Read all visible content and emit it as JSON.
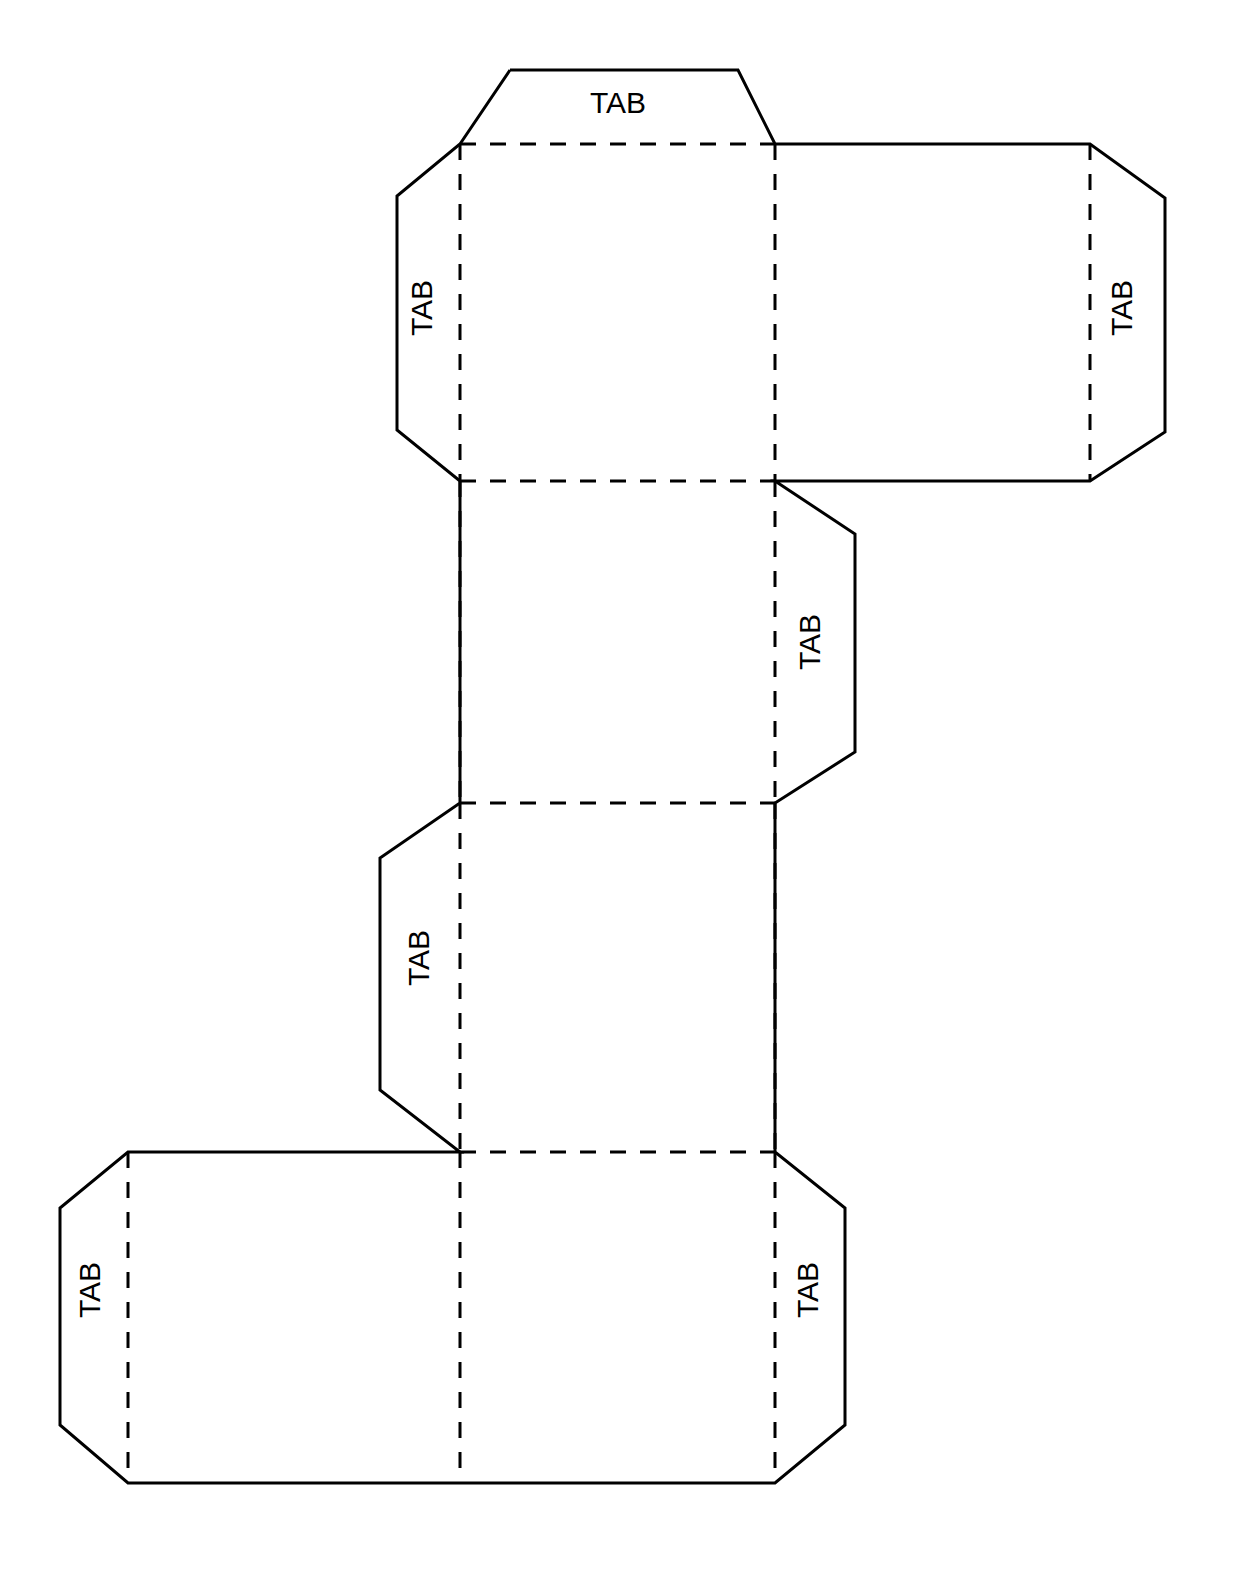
{
  "document": {
    "title": "Cube Net Papercraft Template",
    "description": "Printable fold-out net of a rectangular box with glue tabs",
    "background_color": "#ffffff",
    "line_color": "#000000",
    "cut_line_width": 3,
    "fold_line_width": 3,
    "fold_dash_pattern": "16 14",
    "canvas": {
      "width": 1248,
      "height": 1596
    }
  },
  "labels": {
    "tab_text": "TAB",
    "font_size": 30
  },
  "geometry": {
    "grid_x": [
      60,
      128,
      397,
      460,
      775,
      845,
      855,
      1090,
      1165
    ],
    "grid_y": [
      70,
      144,
      481,
      803,
      1152,
      1483
    ]
  },
  "panels": [
    {
      "id": "panel-top-face",
      "name": "top-face",
      "x1": 460,
      "y1": 144,
      "x2": 775,
      "y2": 481
    },
    {
      "id": "panel-right-face",
      "name": "right-face",
      "x1": 775,
      "y1": 144,
      "x2": 1090,
      "y2": 481
    },
    {
      "id": "panel-upper-middle-face",
      "name": "upper-middle-face",
      "x1": 460,
      "y1": 481,
      "x2": 775,
      "y2": 803
    },
    {
      "id": "panel-lower-middle-face",
      "name": "lower-middle-face",
      "x1": 460,
      "y1": 803,
      "x2": 775,
      "y2": 1152
    },
    {
      "id": "panel-bottom-left-face",
      "name": "bottom-left-face",
      "x1": 128,
      "y1": 1152,
      "x2": 460,
      "y2": 1483
    },
    {
      "id": "panel-bottom-right-face",
      "name": "bottom-right-face",
      "x1": 460,
      "y1": 1152,
      "x2": 775,
      "y2": 1483
    }
  ],
  "tabs": [
    {
      "id": "tab-top",
      "name": "tab-top",
      "label": "TAB",
      "orientation": "horizontal",
      "rotation": 0,
      "label_x": 618,
      "label_y": 105,
      "outline": "460,144 510,70 738,70 775,144"
    },
    {
      "id": "tab-top-left",
      "name": "tab-top-left",
      "label": "TAB",
      "orientation": "vertical",
      "rotation": -90,
      "label_x": 424,
      "label_y": 308,
      "outline": "460,144 397,196 397,430 460,481"
    },
    {
      "id": "tab-far-right",
      "name": "tab-far-right",
      "label": "TAB",
      "orientation": "vertical",
      "rotation": -90,
      "label_x": 1124,
      "label_y": 308,
      "outline": "1090,144 1165,198 1165,432 1090,481"
    },
    {
      "id": "tab-middle-right",
      "name": "tab-middle-right",
      "label": "TAB",
      "orientation": "vertical",
      "rotation": -90,
      "label_x": 812,
      "label_y": 642,
      "outline": "775,481 855,534 855,752 775,803"
    },
    {
      "id": "tab-middle-left",
      "name": "tab-middle-left",
      "label": "TAB",
      "orientation": "vertical",
      "rotation": -90,
      "label_x": 421,
      "label_y": 958,
      "outline": "460,803 380,858 380,1090 460,1152"
    },
    {
      "id": "tab-bottom-left",
      "name": "tab-bottom-left",
      "label": "TAB",
      "orientation": "vertical",
      "rotation": -90,
      "label_x": 92,
      "label_y": 1290,
      "outline": "128,1152 60,1208 60,1425 128,1483"
    },
    {
      "id": "tab-bottom-right",
      "name": "tab-bottom-right",
      "label": "TAB",
      "orientation": "vertical",
      "rotation": -90,
      "label_x": 810,
      "label_y": 1290,
      "outline": "775,1152 845,1208 845,1425 775,1483"
    }
  ],
  "cut_outline": "510,70 738,70 775,144 1090,144 1165,198 1165,432 1090,481 775,481 855,534 855,752 775,803 775,1152 845,1208 845,1425 775,1483 128,1483 60,1425 60,1208 128,1152 460,1152 380,1090 380,858 460,803 460,481 397,430 397,196 460,144 510,70",
  "fold_lines": [
    {
      "id": "fold-top-tab",
      "name": "fold-top-tab",
      "x1": 460,
      "y1": 144,
      "x2": 775,
      "y2": 144
    },
    {
      "id": "fold-top-left-tab",
      "name": "fold-top-left-tab",
      "x1": 460,
      "y1": 144,
      "x2": 460,
      "y2": 481
    },
    {
      "id": "fold-top-right-edge",
      "name": "fold-top-right-edge",
      "x1": 775,
      "y1": 144,
      "x2": 775,
      "y2": 481
    },
    {
      "id": "fold-far-right-tab",
      "name": "fold-far-right-tab",
      "x1": 1090,
      "y1": 144,
      "x2": 1090,
      "y2": 481
    },
    {
      "id": "fold-top-bottom-edge",
      "name": "fold-top-bottom-edge",
      "x1": 460,
      "y1": 481,
      "x2": 775,
      "y2": 481
    },
    {
      "id": "fold-middle-left-edge",
      "name": "fold-middle-left-edge",
      "x1": 460,
      "y1": 481,
      "x2": 460,
      "y2": 803
    },
    {
      "id": "fold-middle-right-tab",
      "name": "fold-middle-right-tab",
      "x1": 775,
      "y1": 481,
      "x2": 775,
      "y2": 803
    },
    {
      "id": "fold-middle-divider",
      "name": "fold-middle-divider",
      "x1": 460,
      "y1": 803,
      "x2": 775,
      "y2": 803
    },
    {
      "id": "fold-lower-left-tab",
      "name": "fold-lower-left-tab",
      "x1": 460,
      "y1": 803,
      "x2": 460,
      "y2": 1152
    },
    {
      "id": "fold-lower-right-edge",
      "name": "fold-lower-right-edge",
      "x1": 775,
      "y1": 803,
      "x2": 775,
      "y2": 1152
    },
    {
      "id": "fold-bottom-top-edge",
      "name": "fold-bottom-top-edge",
      "x1": 460,
      "y1": 1152,
      "x2": 775,
      "y2": 1152
    },
    {
      "id": "fold-bottom-left-tab",
      "name": "fold-bottom-left-tab",
      "x1": 128,
      "y1": 1152,
      "x2": 128,
      "y2": 1483
    },
    {
      "id": "fold-bottom-center",
      "name": "fold-bottom-center",
      "x1": 460,
      "y1": 1152,
      "x2": 460,
      "y2": 1483
    },
    {
      "id": "fold-bottom-right-tab",
      "name": "fold-bottom-right-tab",
      "x1": 775,
      "y1": 1152,
      "x2": 775,
      "y2": 1483
    }
  ]
}
